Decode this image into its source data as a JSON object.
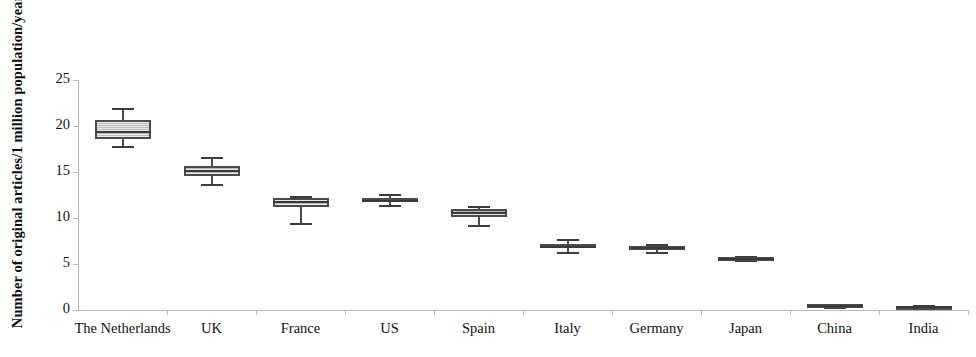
{
  "chart_data": {
    "type": "box",
    "title": "",
    "xlabel": "",
    "ylabel": "Number of original articles/1 million population/year",
    "ylim": [
      0,
      25
    ],
    "ytick_labels": [
      "0",
      "5",
      "10",
      "15",
      "20",
      "25"
    ],
    "ytick_values": [
      0,
      5,
      10,
      15,
      20,
      25
    ],
    "grid": false,
    "legend": "none",
    "categories": [
      "The Netherlands",
      "UK",
      "France",
      "US",
      "Spain",
      "Italy",
      "Germany",
      "Japan",
      "China",
      "India"
    ],
    "boxes": [
      {
        "category": "The Netherlands",
        "whisker_low": 17.8,
        "q1": 18.6,
        "median": 19.5,
        "q3": 20.6,
        "whisker_high": 22.0
      },
      {
        "category": "UK",
        "whisker_low": 13.7,
        "q1": 14.6,
        "median": 15.2,
        "q3": 15.7,
        "whisker_high": 16.6
      },
      {
        "category": "France",
        "whisker_low": 9.5,
        "q1": 11.2,
        "median": 11.8,
        "q3": 12.2,
        "whisker_high": 12.4
      },
      {
        "category": "US",
        "whisker_low": 11.4,
        "q1": 11.8,
        "median": 12.0,
        "q3": 12.2,
        "whisker_high": 12.6
      },
      {
        "category": "Spain",
        "whisker_low": 9.2,
        "q1": 10.1,
        "median": 10.6,
        "q3": 11.0,
        "whisker_high": 11.3
      },
      {
        "category": "Italy",
        "whisker_low": 6.3,
        "q1": 6.8,
        "median": 7.0,
        "q3": 7.2,
        "whisker_high": 7.7
      },
      {
        "category": "Germany",
        "whisker_low": 6.3,
        "q1": 6.6,
        "median": 6.8,
        "q3": 7.0,
        "whisker_high": 7.2
      },
      {
        "category": "Japan",
        "whisker_low": 5.4,
        "q1": 5.5,
        "median": 5.6,
        "q3": 5.8,
        "whisker_high": 5.9
      },
      {
        "category": "China",
        "whisker_low": 0.3,
        "q1": 0.4,
        "median": 0.5,
        "q3": 0.6,
        "whisker_high": 0.7
      },
      {
        "category": "India",
        "whisker_low": 0.3,
        "q1": 0.35,
        "median": 0.4,
        "q3": 0.45,
        "whisker_high": 0.5
      }
    ],
    "colors": {
      "box_fill": "#cfcfcf",
      "box_edge": "#4b4b4b",
      "median": "#3a3a3a",
      "whisker": "#4a4a4a",
      "axis": "#b9b9b9",
      "text": "#111111"
    }
  }
}
